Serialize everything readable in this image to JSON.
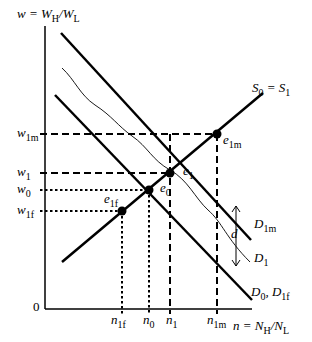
{
  "y_axis": {
    "var": "w",
    "eq": " = ",
    "num": "W",
    "num_sub": "H",
    "slash": "/",
    "den": "W",
    "den_sub": "L"
  },
  "x_axis": {
    "var": "n",
    "eq": " = ",
    "num": "N",
    "num_sub": "H",
    "slash": "/",
    "den": "N",
    "den_sub": "L"
  },
  "origin": "0",
  "curves": {
    "supply": {
      "main": "S",
      "sub0": "0",
      "eq": " = ",
      "main2": "S",
      "sub1": "1"
    },
    "d1m": {
      "main": "D",
      "sub": "1m"
    },
    "d1": {
      "main": "D",
      "sub": "1"
    },
    "d0": {
      "main": "D",
      "sub0": "0",
      "comma": ", ",
      "main2": "D",
      "sub1": "1f"
    }
  },
  "gap_label": "d",
  "wage_labels": [
    {
      "main": "w",
      "sub": "1m"
    },
    {
      "main": "w",
      "sub": "1"
    },
    {
      "main": "w",
      "sub": "0"
    },
    {
      "main": "w",
      "sub": "1f"
    }
  ],
  "quantity_labels": [
    {
      "main": "n",
      "sub": "1f"
    },
    {
      "main": "n",
      "sub": "0"
    },
    {
      "main": "n",
      "sub": "1"
    },
    {
      "main": "n",
      "sub": "1m"
    }
  ],
  "equilibria": [
    {
      "main": "e",
      "sub": "1m"
    },
    {
      "main": "e",
      "sub": "1"
    },
    {
      "main": "e",
      "sub": "0"
    },
    {
      "main": "e",
      "sub": "1f"
    }
  ]
}
